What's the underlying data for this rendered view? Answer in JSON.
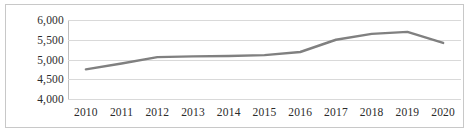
{
  "chart_data": {
    "type": "line",
    "title": "",
    "subtitle": "",
    "xlabel": "",
    "ylabel": "",
    "categories": [
      "2010",
      "2011",
      "2012",
      "2013",
      "2014",
      "2015",
      "2016",
      "2017",
      "2018",
      "2019",
      "2020"
    ],
    "series": [
      {
        "name": "",
        "values": [
          4750,
          4900,
          5060,
          5080,
          5090,
          5110,
          5190,
          5500,
          5650,
          5700,
          5420
        ]
      }
    ],
    "ylim": [
      4000,
      6000
    ],
    "yticks": [
      4000,
      4500,
      5000,
      5500,
      6000
    ],
    "ytick_labels": [
      "4,000",
      "4,500",
      "5,000",
      "5,500",
      "6,000"
    ],
    "grid": true,
    "grid_axis": "y",
    "legend": false,
    "legend_position": "none",
    "markers": false,
    "colors": {
      "line": "#808080",
      "grid": "#d9d9d9",
      "axis": "#bfbfbf",
      "border": "#c8c8c8",
      "text": "#2b2b2b",
      "background": "#ffffff"
    }
  }
}
